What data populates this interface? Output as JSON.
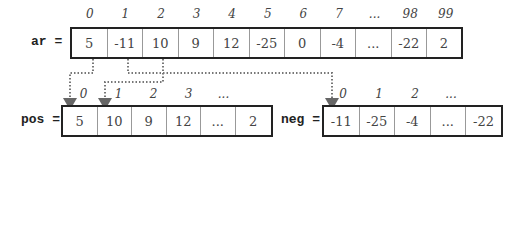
{
  "arrays": {
    "ar": {
      "label": "ar =",
      "indices": [
        "0",
        "1",
        "2",
        "3",
        "4",
        "5",
        "6",
        "7",
        "...",
        "98",
        "99"
      ],
      "values": [
        "5",
        "-11",
        "10",
        "9",
        "12",
        "-25",
        "0",
        "-4",
        "...",
        "-22",
        "2"
      ]
    },
    "pos": {
      "label": "pos =",
      "indices": [
        "0",
        "1",
        "2",
        "3",
        "...",
        ""
      ],
      "values": [
        "5",
        "10",
        "9",
        "12",
        "...",
        "2"
      ]
    },
    "neg": {
      "label": "neg =",
      "indices": [
        "0",
        "1",
        "2",
        "...",
        ""
      ],
      "values": [
        "-11",
        "-25",
        "-4",
        "...",
        "-22"
      ]
    }
  },
  "connectors": [
    {
      "from": "ar[0]",
      "to": "pos[0]"
    },
    {
      "from": "ar[2]",
      "to": "pos[1]"
    },
    {
      "from": "ar[1]",
      "to": "neg[0]"
    }
  ],
  "colors": {
    "border": "#222222",
    "divider": "#999999",
    "connector": "#777777",
    "arrowhead": "#666666"
  }
}
